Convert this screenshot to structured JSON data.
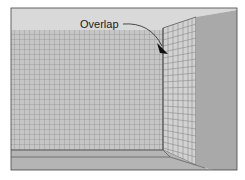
{
  "diagram": {
    "annotation": "Overlap",
    "colors": {
      "ceiling": "#d9d9d9",
      "back_wall": "#c4c4c4",
      "grid_lines": "#8a8a8a",
      "return_wall": "#cfcfcf",
      "side_wall": "#a9a9a9",
      "floor": "#b3b3b3",
      "outline": "#333333",
      "arrow": "#111111"
    }
  }
}
